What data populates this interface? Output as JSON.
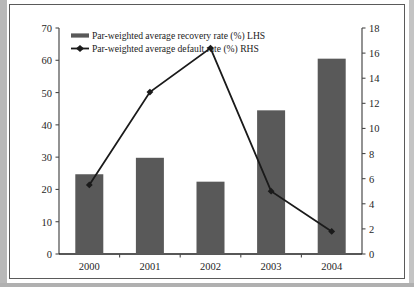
{
  "chart_data": {
    "type": "bar",
    "title": "",
    "subtitle": "",
    "xlabel": "",
    "ylabel": "",
    "categories": [
      "2000",
      "2001",
      "2002",
      "2003",
      "2004"
    ],
    "grid": false,
    "legend_position": "top-left",
    "axes": {
      "left": {
        "label": "",
        "ylim": [
          0,
          70
        ],
        "ticks": [
          0,
          10,
          20,
          30,
          40,
          50,
          60,
          70
        ],
        "tick_labels": [
          "0",
          "10",
          "20",
          "30",
          "40",
          "50",
          "60",
          "70"
        ]
      },
      "right": {
        "label": "",
        "ylim": [
          0,
          18
        ],
        "ticks": [
          0,
          2,
          4,
          6,
          8,
          10,
          12,
          14,
          16,
          18
        ],
        "tick_labels": [
          "0",
          "2",
          "4",
          "6",
          "8",
          "10",
          "12",
          "14",
          "16",
          "18"
        ]
      }
    },
    "series": [
      {
        "name": "Par-weighted average recovery rate (%) LHS",
        "type": "bar",
        "axis": "left",
        "color": "#595959",
        "values": [
          24.7,
          29.8,
          22.4,
          44.5,
          60.5
        ]
      },
      {
        "name": "Par-weighted average default rate (%) RHS",
        "type": "line",
        "axis": "right",
        "color": "#1a1a1a",
        "marker": "diamond",
        "values": [
          5.5,
          12.9,
          16.4,
          5.0,
          1.8
        ]
      }
    ]
  },
  "legend": {
    "entries": [
      {
        "label": "Par-weighted average recovery rate (%) LHS",
        "swatch": "bar-swatch",
        "color": "#595959"
      },
      {
        "label": "Par-weighted average default rate (%) RHS",
        "swatch": "line-marker-swatch",
        "color": "#1a1a1a"
      }
    ]
  }
}
